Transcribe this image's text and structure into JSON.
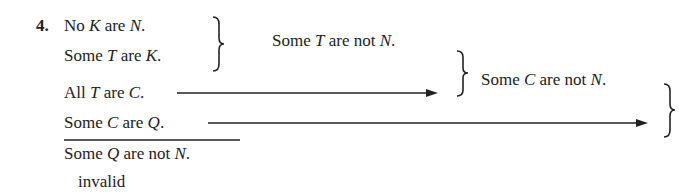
{
  "problem": {
    "number": "4.",
    "premises": [
      {
        "pre": "No ",
        "v1": "K",
        "mid": " are ",
        "v2": "N",
        "post": "."
      },
      {
        "pre": "Some ",
        "v1": "T",
        "mid": " are ",
        "v2": "K",
        "post": "."
      },
      {
        "pre": "All ",
        "v1": "T",
        "mid": " are ",
        "v2": "C",
        "post": "."
      },
      {
        "pre": "Some ",
        "v1": "C",
        "mid": " are ",
        "v2": "Q",
        "post": "."
      }
    ],
    "conclusion": {
      "pre": "Some ",
      "v1": "Q",
      "mid": " are not ",
      "v2": "N",
      "post": "."
    },
    "verdict": "invalid"
  },
  "intermediate": [
    {
      "pre": "Some ",
      "v1": "T",
      "mid": " are not ",
      "v2": "N",
      "post": "."
    },
    {
      "pre": "Some ",
      "v1": "C",
      "mid": " are not ",
      "v2": "N",
      "post": "."
    }
  ]
}
